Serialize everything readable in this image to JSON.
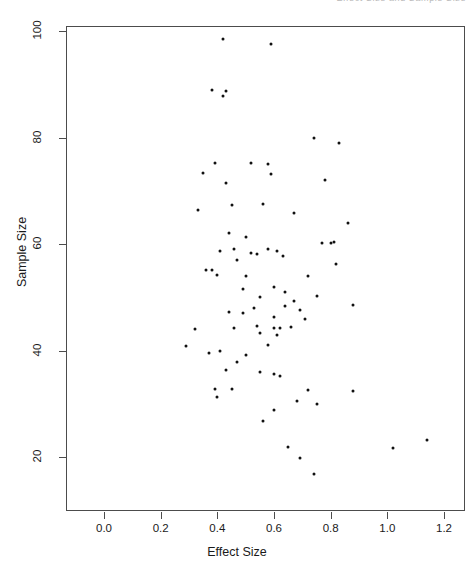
{
  "header": {
    "cropped_text": "Effect Size and Sample Size"
  },
  "axis_labels": {
    "x_title": "Effect Size",
    "y_title": "Sample Size"
  },
  "chart_data": {
    "type": "scatter",
    "title": "",
    "xlabel": "Effect Size",
    "ylabel": "Sample Size",
    "xlim": [
      -0.07,
      1.27
    ],
    "ylim": [
      12,
      103
    ],
    "grid": false,
    "legend": "none",
    "marker": "filled-circle",
    "marker_color": "#111111",
    "xticks": [
      0.0,
      0.2,
      0.4,
      0.6,
      0.8,
      1.0,
      1.2
    ],
    "xtick_labels": [
      "0.0",
      "0.2",
      "0.4",
      "0.6",
      "0.8",
      "1.0",
      "1.2"
    ],
    "yticks": [
      20,
      40,
      60,
      80,
      100
    ],
    "ytick_labels": [
      "20",
      "40",
      "60",
      "80",
      "100"
    ],
    "n_points": 84,
    "points": [
      {
        "x": 0.42,
        "y": 98.5
      },
      {
        "x": 0.59,
        "y": 97.5
      },
      {
        "x": 0.38,
        "y": 88.9
      },
      {
        "x": 0.43,
        "y": 88.7
      },
      {
        "x": 0.42,
        "y": 87.8
      },
      {
        "x": 0.74,
        "y": 79.9
      },
      {
        "x": 0.83,
        "y": 78.9
      },
      {
        "x": 0.39,
        "y": 75.2
      },
      {
        "x": 0.52,
        "y": 75.2
      },
      {
        "x": 0.58,
        "y": 75.0
      },
      {
        "x": 0.35,
        "y": 73.3
      },
      {
        "x": 0.59,
        "y": 73.2
      },
      {
        "x": 0.78,
        "y": 72.0
      },
      {
        "x": 0.43,
        "y": 71.4
      },
      {
        "x": 0.33,
        "y": 66.4
      },
      {
        "x": 0.45,
        "y": 67.3
      },
      {
        "x": 0.56,
        "y": 67.5
      },
      {
        "x": 0.67,
        "y": 65.8
      },
      {
        "x": 0.86,
        "y": 64.0
      },
      {
        "x": 0.44,
        "y": 62.1
      },
      {
        "x": 0.5,
        "y": 61.3
      },
      {
        "x": 0.41,
        "y": 58.6
      },
      {
        "x": 0.46,
        "y": 59.0
      },
      {
        "x": 0.52,
        "y": 58.3
      },
      {
        "x": 0.54,
        "y": 58.2
      },
      {
        "x": 0.58,
        "y": 59.0
      },
      {
        "x": 0.61,
        "y": 58.6
      },
      {
        "x": 0.77,
        "y": 60.2
      },
      {
        "x": 0.81,
        "y": 60.4
      },
      {
        "x": 0.8,
        "y": 60.1
      },
      {
        "x": 0.63,
        "y": 57.8
      },
      {
        "x": 0.47,
        "y": 57.0
      },
      {
        "x": 0.36,
        "y": 55.1
      },
      {
        "x": 0.38,
        "y": 55.1
      },
      {
        "x": 0.4,
        "y": 54.2
      },
      {
        "x": 0.5,
        "y": 54.0
      },
      {
        "x": 0.72,
        "y": 54.0
      },
      {
        "x": 0.82,
        "y": 56.2
      },
      {
        "x": 0.6,
        "y": 52.0
      },
      {
        "x": 0.64,
        "y": 51.0
      },
      {
        "x": 0.49,
        "y": 51.6
      },
      {
        "x": 0.55,
        "y": 50.0
      },
      {
        "x": 0.75,
        "y": 50.3
      },
      {
        "x": 0.67,
        "y": 49.3
      },
      {
        "x": 0.88,
        "y": 48.6
      },
      {
        "x": 0.53,
        "y": 48.0
      },
      {
        "x": 0.44,
        "y": 47.2
      },
      {
        "x": 0.49,
        "y": 47.0
      },
      {
        "x": 0.64,
        "y": 48.4
      },
      {
        "x": 0.69,
        "y": 47.6
      },
      {
        "x": 0.6,
        "y": 46.2
      },
      {
        "x": 0.71,
        "y": 46.0
      },
      {
        "x": 0.32,
        "y": 44.0
      },
      {
        "x": 0.46,
        "y": 44.2
      },
      {
        "x": 0.54,
        "y": 44.6
      },
      {
        "x": 0.6,
        "y": 44.3
      },
      {
        "x": 0.62,
        "y": 44.3
      },
      {
        "x": 0.66,
        "y": 44.4
      },
      {
        "x": 0.55,
        "y": 43.2
      },
      {
        "x": 0.61,
        "y": 43.0
      },
      {
        "x": 0.58,
        "y": 41.1
      },
      {
        "x": 0.41,
        "y": 40.0
      },
      {
        "x": 0.37,
        "y": 39.6
      },
      {
        "x": 0.5,
        "y": 39.2
      },
      {
        "x": 0.47,
        "y": 37.9
      },
      {
        "x": 0.29,
        "y": 40.8
      },
      {
        "x": 0.43,
        "y": 36.3
      },
      {
        "x": 0.55,
        "y": 36.0
      },
      {
        "x": 0.6,
        "y": 35.6
      },
      {
        "x": 0.62,
        "y": 35.3
      },
      {
        "x": 0.45,
        "y": 32.8
      },
      {
        "x": 0.39,
        "y": 32.8
      },
      {
        "x": 0.72,
        "y": 32.5
      },
      {
        "x": 0.88,
        "y": 32.4
      },
      {
        "x": 0.68,
        "y": 30.5
      },
      {
        "x": 0.6,
        "y": 28.8
      },
      {
        "x": 0.75,
        "y": 29.9
      },
      {
        "x": 0.4,
        "y": 31.2
      },
      {
        "x": 0.56,
        "y": 26.8
      },
      {
        "x": 0.65,
        "y": 21.8
      },
      {
        "x": 0.69,
        "y": 19.9
      },
      {
        "x": 0.74,
        "y": 16.8
      },
      {
        "x": 1.02,
        "y": 21.6
      },
      {
        "x": 1.14,
        "y": 23.2
      }
    ]
  }
}
